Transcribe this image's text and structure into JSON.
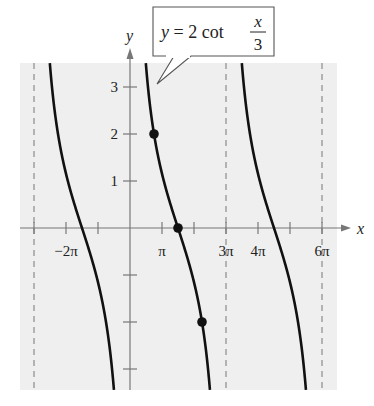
{
  "chart_data": {
    "type": "line",
    "callout": {
      "prefix": "y = 2 cot",
      "numerator": "x",
      "denominator": "3"
    },
    "xlabel": "x",
    "ylabel": "y",
    "xlim_pi": [
      -3.3,
      6.6
    ],
    "ylim": [
      -3.4,
      3.5
    ],
    "x_tick_labels": [
      {
        "pos_pi": -2,
        "label": "−2π"
      },
      {
        "pos_pi": 1,
        "label": "π"
      },
      {
        "pos_pi": 3,
        "label": "3π"
      },
      {
        "pos_pi": 4,
        "label": "4π"
      },
      {
        "pos_pi": 6,
        "label": "6π"
      }
    ],
    "x_ticks_pi": [
      -3,
      -2,
      -1,
      1,
      2,
      3,
      4,
      5,
      6
    ],
    "y_tick_labels": [
      {
        "value": 3,
        "label": "3"
      },
      {
        "value": 2,
        "label": "2"
      },
      {
        "value": 1,
        "label": "1"
      }
    ],
    "y_ticks": [
      3,
      2,
      1,
      -1,
      -2,
      -3
    ],
    "asymptotes_pi": [
      -3,
      0,
      3,
      6
    ],
    "series": [
      {
        "name": "y = 2 cot(x/3)",
        "function": "2*cot(x/3)",
        "period_pi": 3,
        "color": "#111111"
      }
    ],
    "points": [
      {
        "x_pi": 0.75,
        "y": 2
      },
      {
        "x_pi": 1.5,
        "y": 0
      },
      {
        "x_pi": 2.25,
        "y": -2
      }
    ],
    "grid": false,
    "background": "#efefef"
  }
}
